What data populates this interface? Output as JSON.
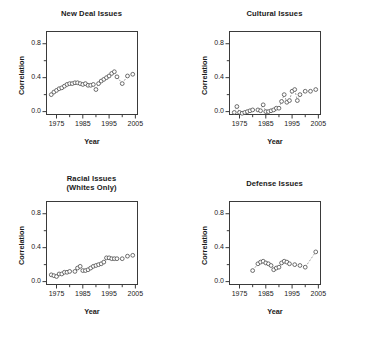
{
  "figure": {
    "background": "#ffffff",
    "marker_color": "#4a4a4a",
    "line_color": "#7a7a7a",
    "axis_color": "#3a3a3a"
  },
  "chart_data": [
    {
      "type": "scatter",
      "title": "New Deal Issues",
      "title_lines": [
        "New Deal Issues"
      ],
      "xlabel": "Year",
      "ylabel": "Correlation",
      "xlim": [
        1971,
        2006
      ],
      "ylim": [
        -0.04,
        0.95
      ],
      "xticks": [
        1975,
        1985,
        1995,
        2005
      ],
      "xtick_labels": [
        "1975",
        "1985",
        "1995",
        "2005"
      ],
      "xminor": [
        1980,
        1990,
        2000
      ],
      "yticks": [
        0.0,
        0.4,
        0.8
      ],
      "ytick_labels": [
        "0.0",
        "0.4",
        "0.8"
      ],
      "yminor": [
        0.2,
        0.6,
        1.0
      ],
      "grid": false,
      "legend": "none",
      "connector": "dashed",
      "x": [
        1973,
        1974,
        1975,
        1976,
        1977,
        1978,
        1979,
        1980,
        1981,
        1982,
        1983,
        1984,
        1985,
        1986,
        1987,
        1988,
        1989,
        1990,
        1991,
        1992,
        1993,
        1994,
        1995,
        1996,
        1997,
        1998,
        2000,
        2002,
        2004
      ],
      "y": [
        0.2,
        0.23,
        0.25,
        0.27,
        0.28,
        0.3,
        0.32,
        0.33,
        0.33,
        0.34,
        0.34,
        0.33,
        0.32,
        0.33,
        0.31,
        0.31,
        0.32,
        0.26,
        0.33,
        0.36,
        0.38,
        0.4,
        0.42,
        0.45,
        0.47,
        0.41,
        0.33,
        0.42,
        0.44
      ]
    },
    {
      "type": "scatter",
      "title": "Cultural Issues",
      "title_lines": [
        "Cultural Issues"
      ],
      "xlabel": "Year",
      "ylabel": "Correlation",
      "xlim": [
        1971,
        2006
      ],
      "ylim": [
        -0.04,
        0.95
      ],
      "xticks": [
        1975,
        1985,
        1995,
        2005
      ],
      "xtick_labels": [
        "1975",
        "1985",
        "1995",
        "2005"
      ],
      "xminor": [
        1980,
        1990,
        2000
      ],
      "yticks": [
        0.0,
        0.4,
        0.8
      ],
      "ytick_labels": [
        "0.0",
        "0.4",
        "0.8"
      ],
      "yminor": [
        0.2,
        0.6,
        1.0
      ],
      "grid": false,
      "legend": "none",
      "connector": "dashed",
      "x": [
        1973,
        1974,
        1975,
        1976,
        1977,
        1978,
        1979,
        1980,
        1982,
        1983,
        1984,
        1985,
        1986,
        1987,
        1988,
        1989,
        1990,
        1991,
        1992,
        1993,
        1994,
        1995,
        1996,
        1997,
        1998,
        2000,
        2002,
        2004
      ],
      "y": [
        -0.01,
        0.06,
        -0.01,
        -0.02,
        -0.01,
        0.0,
        0.01,
        0.02,
        0.02,
        0.01,
        0.08,
        0.0,
        0.0,
        0.01,
        0.02,
        0.04,
        0.04,
        0.12,
        0.2,
        0.11,
        0.13,
        0.24,
        0.26,
        0.13,
        0.2,
        0.24,
        0.24,
        0.26
      ]
    },
    {
      "type": "scatter",
      "title": "Racial Issues (Whites Only)",
      "title_lines": [
        "Racial Issues",
        "(Whites Only)"
      ],
      "xlabel": "Year",
      "ylabel": "Correlation",
      "xlim": [
        1971,
        2006
      ],
      "ylim": [
        -0.04,
        0.95
      ],
      "xticks": [
        1975,
        1985,
        1995,
        2005
      ],
      "xtick_labels": [
        "1975",
        "1985",
        "1995",
        "2005"
      ],
      "xminor": [
        1980,
        1990,
        2000
      ],
      "yticks": [
        0.0,
        0.4,
        0.8
      ],
      "ytick_labels": [
        "0.0",
        "0.4",
        "0.8"
      ],
      "yminor": [
        0.2,
        0.6,
        1.0
      ],
      "grid": false,
      "legend": "none",
      "connector": "dashed",
      "x": [
        1973,
        1974,
        1975,
        1976,
        1977,
        1978,
        1979,
        1980,
        1982,
        1983,
        1984,
        1985,
        1986,
        1987,
        1988,
        1989,
        1990,
        1991,
        1992,
        1993,
        1994,
        1995,
        1996,
        1997,
        1998,
        2000,
        2002,
        2004
      ],
      "y": [
        0.08,
        0.07,
        0.06,
        0.09,
        0.09,
        0.11,
        0.11,
        0.12,
        0.12,
        0.16,
        0.18,
        0.13,
        0.13,
        0.14,
        0.16,
        0.18,
        0.19,
        0.2,
        0.21,
        0.23,
        0.28,
        0.28,
        0.27,
        0.27,
        0.27,
        0.27,
        0.3,
        0.31
      ]
    },
    {
      "type": "scatter",
      "title": "Defense Issues",
      "title_lines": [
        "Defense Issues"
      ],
      "xlabel": "Year",
      "ylabel": "Correlation",
      "xlim": [
        1971,
        2006
      ],
      "ylim": [
        -0.04,
        0.95
      ],
      "xticks": [
        1975,
        1985,
        1995,
        2005
      ],
      "xtick_labels": [
        "1975",
        "1985",
        "1995",
        "2005"
      ],
      "xminor": [
        1980,
        1990,
        2000
      ],
      "yticks": [
        0.0,
        0.4,
        0.8
      ],
      "ytick_labels": [
        "0.0",
        "0.4",
        "0.8"
      ],
      "yminor": [
        0.2,
        0.6,
        1.0
      ],
      "grid": false,
      "legend": "none",
      "connector": "dashed",
      "x": [
        1980,
        1982,
        1983,
        1984,
        1985,
        1986,
        1987,
        1988,
        1989,
        1990,
        1991,
        1992,
        1993,
        1994,
        1996,
        1998,
        2000,
        2004
      ],
      "y": [
        0.13,
        0.21,
        0.23,
        0.24,
        0.22,
        0.21,
        0.19,
        0.14,
        0.16,
        0.17,
        0.22,
        0.24,
        0.23,
        0.21,
        0.2,
        0.19,
        0.17,
        0.35
      ]
    }
  ]
}
